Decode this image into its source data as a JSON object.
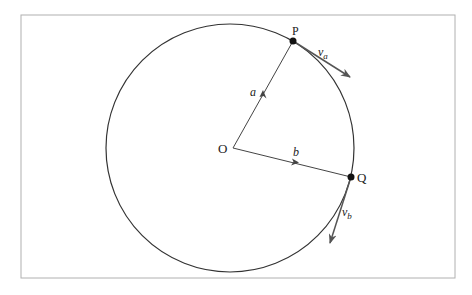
{
  "diagram": {
    "type": "circular-motion-vectors",
    "frame": {
      "x": 21,
      "y": 15,
      "width": 434,
      "height": 263,
      "stroke": "#b0b0b0"
    },
    "circle": {
      "cx": 230,
      "cy": 148,
      "r": 124,
      "stroke": "#333333"
    },
    "points": {
      "O": {
        "label": "O",
        "x": 233,
        "y": 148
      },
      "P": {
        "label": "P",
        "x": 293,
        "y": 41
      },
      "Q": {
        "label": "Q",
        "x": 351,
        "y": 177
      }
    },
    "vectors": {
      "a": {
        "label": "a",
        "from": "O",
        "to": "P"
      },
      "b": {
        "label": "b",
        "from": "O",
        "to": "Q"
      },
      "va": {
        "label": "v",
        "subscript": "a",
        "from": "P",
        "tip": [
          350,
          77
        ]
      },
      "vb": {
        "label": "v",
        "subscript": "b",
        "from": "Q",
        "tip": [
          330,
          243
        ]
      }
    },
    "colors": {
      "line": "#333333",
      "tangent_arrow": "#555555",
      "point": "#111111"
    }
  }
}
